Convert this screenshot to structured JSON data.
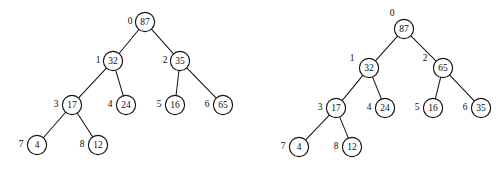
{
  "figure": {
    "background_color": "#ffffff",
    "stroke_color": "#141414",
    "text_color": "#0d0d0d",
    "node_radius": 9.6
  },
  "diagram_data": {
    "type": "binary-heap-diagram",
    "description": "Two array-indexed binary trees (max-heaps) drawn side by side; the right tree shows node values 65 and 35 swapped relative to the left tree.",
    "trees": [
      {
        "name": "left-tree",
        "nodes": [
          {
            "index": "0",
            "value": "87",
            "cx": 145,
            "cy": 22,
            "lx": 130,
            "ly": 21
          },
          {
            "index": "1",
            "value": "32",
            "cx": 113,
            "cy": 61,
            "lx": 98,
            "ly": 60
          },
          {
            "index": "2",
            "value": "35",
            "cx": 180,
            "cy": 61,
            "lx": 165,
            "ly": 60
          },
          {
            "index": "3",
            "value": "17",
            "cx": 72,
            "cy": 105,
            "lx": 56,
            "ly": 104
          },
          {
            "index": "4",
            "value": "24",
            "cx": 126,
            "cy": 105,
            "lx": 110,
            "ly": 104
          },
          {
            "index": "5",
            "value": "16",
            "cx": 175,
            "cy": 105,
            "lx": 159,
            "ly": 104
          },
          {
            "index": "6",
            "value": "65",
            "cx": 223,
            "cy": 105,
            "lx": 207,
            "ly": 104
          },
          {
            "index": "7",
            "value": "4",
            "cx": 37,
            "cy": 145,
            "lx": 21,
            "ly": 144
          },
          {
            "index": "8",
            "value": "12",
            "cx": 98,
            "cy": 145,
            "lx": 82,
            "ly": 144
          }
        ],
        "edges": [
          [
            0,
            1
          ],
          [
            0,
            2
          ],
          [
            1,
            3
          ],
          [
            1,
            4
          ],
          [
            2,
            5
          ],
          [
            2,
            6
          ],
          [
            3,
            7
          ],
          [
            3,
            8
          ]
        ]
      },
      {
        "name": "right-tree",
        "nodes": [
          {
            "index": "0",
            "value": "87",
            "cx": 404,
            "cy": 29,
            "lx": 392,
            "ly": 13
          },
          {
            "index": "1",
            "value": "32",
            "cx": 369,
            "cy": 68,
            "lx": 352,
            "ly": 58
          },
          {
            "index": "2",
            "value": "65",
            "cx": 443,
            "cy": 68,
            "lx": 425,
            "ly": 58
          },
          {
            "index": "3",
            "value": "17",
            "cx": 336,
            "cy": 108,
            "lx": 320,
            "ly": 107
          },
          {
            "index": "4",
            "value": "24",
            "cx": 385,
            "cy": 108,
            "lx": 369,
            "ly": 107
          },
          {
            "index": "5",
            "value": "16",
            "cx": 433,
            "cy": 108,
            "lx": 417,
            "ly": 107
          },
          {
            "index": "6",
            "value": "35",
            "cx": 481,
            "cy": 108,
            "lx": 465,
            "ly": 107
          },
          {
            "index": "7",
            "value": "4",
            "cx": 299,
            "cy": 147,
            "lx": 283,
            "ly": 146
          },
          {
            "index": "8",
            "value": "12",
            "cx": 352,
            "cy": 147,
            "lx": 336,
            "ly": 146
          }
        ],
        "edges": [
          [
            0,
            1
          ],
          [
            0,
            2
          ],
          [
            1,
            3
          ],
          [
            1,
            4
          ],
          [
            2,
            5
          ],
          [
            2,
            6
          ],
          [
            3,
            7
          ],
          [
            3,
            8
          ]
        ]
      }
    ]
  }
}
